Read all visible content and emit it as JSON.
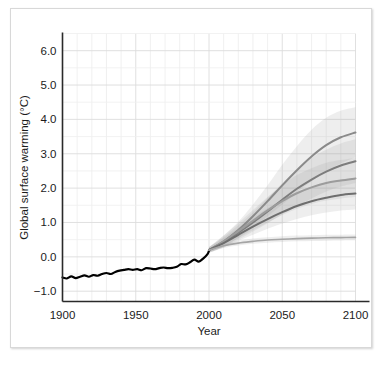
{
  "chart_data": {
    "type": "line",
    "title": "",
    "xlabel": "Year",
    "ylabel": "Global surface warming (°C)",
    "xlim": [
      1900,
      2100
    ],
    "ylim": [
      -1.3,
      6.5
    ],
    "xticks": [
      1900,
      1950,
      2000,
      2050,
      2100
    ],
    "xtick_labels": [
      "1900",
      "1950",
      "2000",
      "2050",
      "2100"
    ],
    "yticks": [
      -1.0,
      0.0,
      1.0,
      2.0,
      3.0,
      4.0,
      5.0,
      6.0
    ],
    "ytick_labels": [
      "−1.0",
      "0.0",
      "1.0",
      "2.0",
      "3.0",
      "4.0",
      "5.0",
      "6.0"
    ],
    "grid": true,
    "grid_x_step": 10,
    "grid_y_step": 0.5,
    "legend": "none",
    "series": [
      {
        "name": "observed",
        "color": "#000000",
        "width": 2.2,
        "x": [
          1900,
          1903,
          1906,
          1909,
          1912,
          1915,
          1918,
          1921,
          1924,
          1927,
          1930,
          1933,
          1936,
          1939,
          1942,
          1945,
          1948,
          1951,
          1954,
          1957,
          1960,
          1963,
          1966,
          1969,
          1972,
          1975,
          1978,
          1981,
          1984,
          1987,
          1990,
          1993,
          1996,
          1999,
          2000
        ],
        "values": [
          -0.6,
          -0.63,
          -0.57,
          -0.62,
          -0.58,
          -0.54,
          -0.58,
          -0.53,
          -0.55,
          -0.5,
          -0.47,
          -0.5,
          -0.44,
          -0.4,
          -0.38,
          -0.36,
          -0.38,
          -0.36,
          -0.39,
          -0.33,
          -0.34,
          -0.36,
          -0.33,
          -0.31,
          -0.33,
          -0.32,
          -0.29,
          -0.21,
          -0.22,
          -0.16,
          -0.08,
          -0.14,
          -0.05,
          0.08,
          0.18
        ]
      },
      {
        "name": "A1FI",
        "color": "#8a8a8a",
        "width": 2.0,
        "x": [
          2000,
          2010,
          2020,
          2030,
          2040,
          2050,
          2060,
          2070,
          2080,
          2090,
          2100
        ],
        "values": [
          0.2,
          0.45,
          0.78,
          1.18,
          1.62,
          2.08,
          2.52,
          2.92,
          3.25,
          3.48,
          3.62
        ],
        "band_lo": [
          0.12,
          0.3,
          0.55,
          0.85,
          1.18,
          1.52,
          1.88,
          2.2,
          2.5,
          2.72,
          2.9
        ],
        "band_hi": [
          0.28,
          0.62,
          1.02,
          1.52,
          2.08,
          2.68,
          3.22,
          3.7,
          4.05,
          4.25,
          4.35
        ]
      },
      {
        "name": "A2",
        "color": "#7d7d7d",
        "width": 2.0,
        "x": [
          2000,
          2010,
          2020,
          2030,
          2040,
          2050,
          2060,
          2070,
          2080,
          2090,
          2100
        ],
        "values": [
          0.2,
          0.42,
          0.7,
          1.0,
          1.32,
          1.66,
          1.98,
          2.25,
          2.48,
          2.66,
          2.78
        ],
        "band_lo": [
          0.12,
          0.28,
          0.5,
          0.74,
          0.98,
          1.24,
          1.48,
          1.7,
          1.9,
          2.05,
          2.15
        ],
        "band_hi": [
          0.28,
          0.58,
          0.92,
          1.3,
          1.72,
          2.14,
          2.52,
          2.88,
          3.12,
          3.3,
          3.42
        ]
      },
      {
        "name": "A1B",
        "color": "#9c9c9c",
        "width": 2.0,
        "x": [
          2000,
          2010,
          2020,
          2030,
          2040,
          2050,
          2060,
          2070,
          2080,
          2090,
          2100
        ],
        "values": [
          0.2,
          0.45,
          0.75,
          1.05,
          1.35,
          1.62,
          1.85,
          2.02,
          2.15,
          2.22,
          2.28
        ],
        "band_lo": [
          0.12,
          0.3,
          0.54,
          0.78,
          1.0,
          1.22,
          1.4,
          1.54,
          1.64,
          1.7,
          1.74
        ],
        "band_hi": [
          0.28,
          0.62,
          0.98,
          1.36,
          1.74,
          2.08,
          2.38,
          2.58,
          2.74,
          2.82,
          2.88
        ]
      },
      {
        "name": "B1",
        "color": "#6e6e6e",
        "width": 2.0,
        "x": [
          2000,
          2010,
          2020,
          2030,
          2040,
          2050,
          2060,
          2070,
          2080,
          2090,
          2100
        ],
        "values": [
          0.2,
          0.4,
          0.64,
          0.88,
          1.1,
          1.3,
          1.48,
          1.62,
          1.72,
          1.8,
          1.84
        ],
        "band_lo": [
          0.12,
          0.27,
          0.46,
          0.64,
          0.82,
          0.97,
          1.1,
          1.21,
          1.29,
          1.35,
          1.38
        ],
        "band_hi": [
          0.28,
          0.55,
          0.84,
          1.14,
          1.42,
          1.66,
          1.88,
          2.04,
          2.16,
          2.25,
          2.3
        ]
      },
      {
        "name": "Year 2000 constant concentrations",
        "color": "#a5a5a5",
        "width": 1.6,
        "x": [
          2000,
          2010,
          2020,
          2030,
          2040,
          2050,
          2060,
          2070,
          2080,
          2090,
          2100
        ],
        "values": [
          0.2,
          0.32,
          0.4,
          0.45,
          0.49,
          0.51,
          0.53,
          0.545,
          0.555,
          0.56,
          0.565
        ],
        "band_lo": [
          0.16,
          0.26,
          0.33,
          0.38,
          0.41,
          0.43,
          0.45,
          0.46,
          0.47,
          0.475,
          0.48
        ],
        "band_hi": [
          0.24,
          0.38,
          0.47,
          0.53,
          0.57,
          0.6,
          0.62,
          0.63,
          0.64,
          0.645,
          0.65
        ]
      }
    ]
  }
}
